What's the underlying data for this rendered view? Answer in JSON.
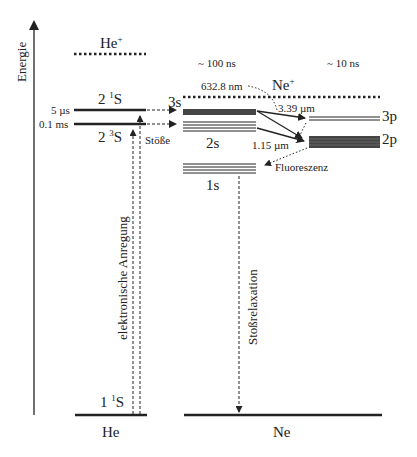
{
  "diagram": {
    "axis": {
      "label": "Energie"
    },
    "helium": {
      "name": "He",
      "ion": {
        "label": "He",
        "charge": "+"
      },
      "levels": [
        {
          "id": "2_1S",
          "prefix": "2 ",
          "sup": "1",
          "suffix": "S",
          "lifetime": "5 µs"
        },
        {
          "id": "2_3S",
          "prefix": "2 ",
          "sup": "3",
          "suffix": "S",
          "lifetime": "0.1 ms"
        },
        {
          "id": "1_1S",
          "prefix": "1 ",
          "sup": "1",
          "suffix": "S"
        }
      ],
      "excitation_label": "elektronische Anregung",
      "collision_label": "Stöße"
    },
    "neon": {
      "name": "Ne",
      "ion": {
        "label": "Ne",
        "charge": "+"
      },
      "levels": [
        {
          "id": "3s",
          "label": "3s"
        },
        {
          "id": "2s",
          "label": "2s"
        },
        {
          "id": "1s",
          "label": "1s"
        },
        {
          "id": "3p",
          "label": "3p"
        },
        {
          "id": "2p",
          "label": "2p"
        }
      ],
      "lifetime_s": "~ 100 ns",
      "lifetime_p": "~ 10 ns",
      "transitions": [
        {
          "label": "632.8 nm"
        },
        {
          "label": "3.39 µm"
        },
        {
          "label": "1.15 µm"
        }
      ],
      "fluorescence_label": "Fluoreszenz",
      "relaxation_label": "Stoßrelaxation"
    }
  }
}
